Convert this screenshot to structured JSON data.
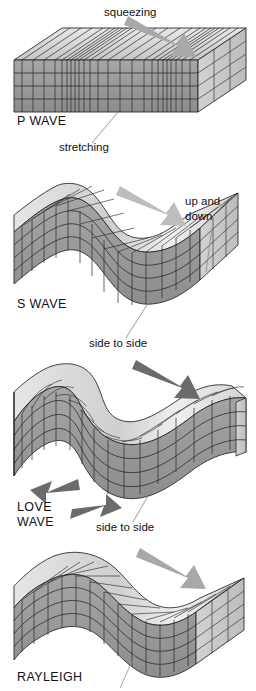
{
  "figure": {
    "title_implicit": "Seismic wave types block diagrams",
    "background_color": "#ffffff",
    "ink_color": "#111111"
  },
  "palette": {
    "block_top": "#dcdcdc",
    "block_front": "#9a9a9a",
    "block_side_dark": "#8a8a8a",
    "block_end_light": "#c9c9c9",
    "grid_line": "#2b2b2b",
    "arrow_light": "#a8a8a8",
    "arrow_dark": "#666666",
    "leader_line": "#8e8e8e"
  },
  "panels": [
    {
      "id": "p-wave",
      "wave_label": "P WAVE",
      "annotations": [
        {
          "name": "squeezing",
          "text": "squeezing"
        },
        {
          "name": "stretching",
          "text": "stretching"
        }
      ],
      "arrows": [
        {
          "name": "propagation-arrow",
          "direction": "down-right",
          "tone": "light"
        }
      ]
    },
    {
      "id": "s-wave",
      "wave_label": "S WAVE",
      "annotations": [
        {
          "name": "up-and-down",
          "text": "up and\ndown",
          "line1": "up and",
          "line2": "down"
        },
        {
          "name": "side-to-side",
          "text": "side to side"
        }
      ],
      "arrows": [
        {
          "name": "propagation-arrow",
          "direction": "down-right",
          "tone": "light"
        }
      ]
    },
    {
      "id": "love-wave",
      "wave_label_line1": "LOVE",
      "wave_label_line2": "WAVE",
      "annotations": [
        {
          "name": "side-to-side",
          "text": "side to side"
        }
      ],
      "arrows": [
        {
          "name": "propagation-arrow",
          "direction": "down-right",
          "tone": "dark"
        },
        {
          "name": "shear-arrow-left",
          "direction": "left-down",
          "tone": "dark"
        },
        {
          "name": "shear-arrow-right",
          "direction": "right",
          "tone": "dark"
        }
      ]
    },
    {
      "id": "rayleigh-wave",
      "wave_label": "RAYLEIGH",
      "annotations": [],
      "arrows": [
        {
          "name": "propagation-arrow",
          "direction": "down-right",
          "tone": "light"
        }
      ]
    }
  ]
}
